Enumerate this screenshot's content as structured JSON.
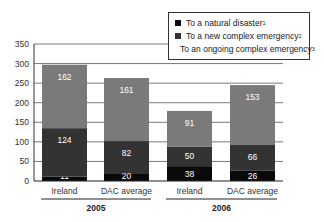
{
  "chart_data": {
    "type": "bar",
    "stacked": true,
    "title": "",
    "xlabel": "",
    "ylabel": "",
    "ylim": [
      0,
      350
    ],
    "yticks": [
      0,
      50,
      100,
      150,
      200,
      250,
      300,
      350
    ],
    "grid": true,
    "legend_position": "top-right",
    "groups": [
      {
        "label": "2005",
        "categories": [
          "Ireland",
          "DAC average"
        ]
      },
      {
        "label": "2006",
        "categories": [
          "Ireland",
          "DAC average"
        ]
      }
    ],
    "categories": [
      "Ireland 2005",
      "DAC average 2005",
      "Ireland 2006",
      "DAC average 2006"
    ],
    "series": [
      {
        "name": "To a natural disaster",
        "footnote": "1",
        "color": "#0a0a0a",
        "values": [
          11,
          20,
          38,
          26
        ]
      },
      {
        "name": "To a new complex emergency",
        "footnote": "2",
        "color": "#333333",
        "values": [
          124,
          82,
          50,
          66
        ]
      },
      {
        "name": "To an ongoing complex emergency",
        "footnote": "3",
        "color": "#7a7a7a",
        "values": [
          162,
          161,
          91,
          153
        ]
      }
    ]
  }
}
